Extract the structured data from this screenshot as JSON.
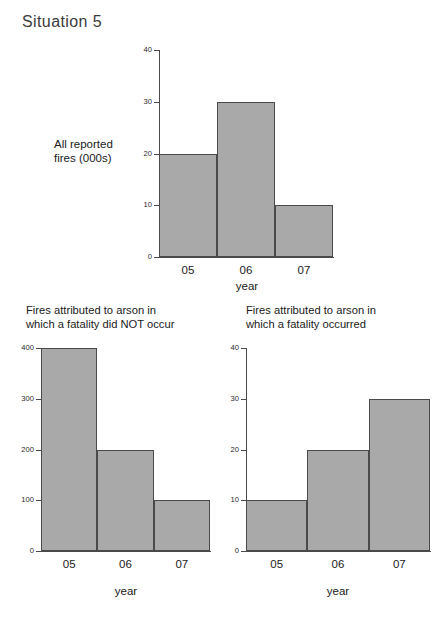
{
  "page": {
    "heading": "Situation 5"
  },
  "chart_data": [
    {
      "id": "all-reported-fires",
      "type": "bar",
      "title": "",
      "side_label": "All reported\nfires (000s)",
      "categories": [
        "05",
        "06",
        "07"
      ],
      "values": [
        20,
        30,
        10
      ],
      "xlabel": "year",
      "ylabel": "",
      "ylim": [
        0,
        40
      ],
      "yticks": [
        0,
        10,
        20,
        30,
        40
      ],
      "ytick_labels": [
        "0",
        "10",
        "20",
        "30",
        "40"
      ],
      "grid": false,
      "legend": "none",
      "bar_color": "#a9a9a9",
      "bar_edge_color": "#4a4a4a"
    },
    {
      "id": "arson-no-fatality",
      "type": "bar",
      "title": "Fires attributed to arson in\nwhich a fatality did NOT occur",
      "side_label": "",
      "categories": [
        "05",
        "06",
        "07"
      ],
      "values": [
        400,
        200,
        100
      ],
      "xlabel": "year",
      "ylabel": "",
      "ylim": [
        0,
        400
      ],
      "yticks": [
        0,
        100,
        200,
        300,
        400
      ],
      "ytick_labels": [
        "0",
        "100",
        "200",
        "300",
        "400"
      ],
      "grid": false,
      "legend": "none",
      "bar_color": "#a9a9a9",
      "bar_edge_color": "#4a4a4a"
    },
    {
      "id": "arson-fatality",
      "type": "bar",
      "title": "Fires attributed to arson in\nwhich a fatality occurred",
      "side_label": "",
      "categories": [
        "05",
        "06",
        "07"
      ],
      "values": [
        10,
        20,
        30
      ],
      "xlabel": "year",
      "ylabel": "",
      "ylim": [
        0,
        40
      ],
      "yticks": [
        0,
        10,
        20,
        30,
        40
      ],
      "ytick_labels": [
        "0",
        "10",
        "20",
        "30",
        "40"
      ],
      "grid": false,
      "legend": "none",
      "bar_color": "#a9a9a9",
      "bar_edge_color": "#4a4a4a"
    }
  ]
}
